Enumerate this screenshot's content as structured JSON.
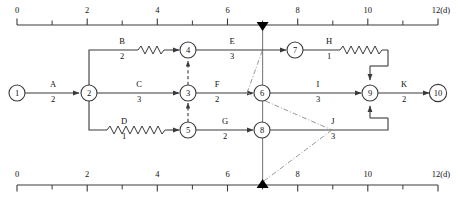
{
  "diagram": {
    "colors": {
      "line": "#3a3a3a",
      "text": "#111111",
      "node_fill": "#ffffff",
      "marker": "#000000"
    },
    "axis": {
      "unit_label": "12(d)",
      "ticks": [
        {
          "value": 0,
          "label": "0",
          "major": true
        },
        {
          "value": 1,
          "label": "",
          "major": false
        },
        {
          "value": 2,
          "label": "2",
          "major": true
        },
        {
          "value": 3,
          "label": "",
          "major": false
        },
        {
          "value": 4,
          "label": "4",
          "major": true
        },
        {
          "value": 5,
          "label": "",
          "major": false
        },
        {
          "value": 6,
          "label": "6",
          "major": true
        },
        {
          "value": 7,
          "label": "",
          "major": false
        },
        {
          "value": 8,
          "label": "8",
          "major": true
        },
        {
          "value": 9,
          "label": "",
          "major": false
        },
        {
          "value": 10,
          "label": "10",
          "major": true
        },
        {
          "value": 11,
          "label": "",
          "major": false
        },
        {
          "value": 12,
          "label": "",
          "major": true
        }
      ],
      "top_label_left": "0",
      "bottom_label_left": "0",
      "top_label_right": "12(d)",
      "bottom_label_right": "12(d)"
    },
    "marker_time": 7,
    "nodes": [
      {
        "id": "1",
        "x": 17,
        "y": 93
      },
      {
        "id": "2",
        "x": 89,
        "y": 93
      },
      {
        "id": "3",
        "x": 188,
        "y": 93
      },
      {
        "id": "4",
        "x": 188,
        "y": 50
      },
      {
        "id": "5",
        "x": 188,
        "y": 130
      },
      {
        "id": "6",
        "x": 262,
        "y": 93
      },
      {
        "id": "7",
        "x": 295,
        "y": 50
      },
      {
        "id": "8",
        "x": 262,
        "y": 130
      },
      {
        "id": "9",
        "x": 370,
        "y": 93
      },
      {
        "id": "10",
        "x": 438,
        "y": 93
      }
    ],
    "activities": [
      {
        "name": "A",
        "duration": "2",
        "from": "1",
        "to": "2",
        "label_x": 53,
        "label_y": 87
      },
      {
        "name": "B",
        "duration": "2",
        "from": "2",
        "to": "4",
        "label_x": 136,
        "label_y": 44
      },
      {
        "name": "C",
        "duration": "3",
        "from": "2",
        "to": "3",
        "label_x": 139,
        "label_y": 87
      },
      {
        "name": "D",
        "duration": "1",
        "from": "2",
        "to": "5",
        "label_x": 139,
        "label_y": 124
      },
      {
        "name": "E",
        "duration": "3",
        "from": "4",
        "to": "7",
        "label_x": 232,
        "label_y": 44
      },
      {
        "name": "F",
        "duration": "2",
        "from": "3",
        "to": "6",
        "label_x": 217,
        "label_y": 87
      },
      {
        "name": "G",
        "duration": "2",
        "from": "5",
        "to": "8",
        "label_x": 225,
        "label_y": 124
      },
      {
        "name": "H",
        "duration": "1",
        "from": "7",
        "to": "9",
        "label_x": 337,
        "label_y": 44
      },
      {
        "name": "I",
        "duration": "3",
        "from": "6",
        "to": "9",
        "label_x": 318,
        "label_y": 87
      },
      {
        "name": "J",
        "duration": "3",
        "from": "8",
        "to": "9",
        "label_x": 333,
        "label_y": 124
      },
      {
        "name": "K",
        "duration": "2",
        "from": "9",
        "to": "10",
        "label_x": 404,
        "label_y": 87
      }
    ],
    "dummy_links": [
      {
        "from": "5",
        "to": "3",
        "style": "dashed"
      },
      {
        "from": "3",
        "to": "4",
        "style": "dashed"
      }
    ]
  }
}
